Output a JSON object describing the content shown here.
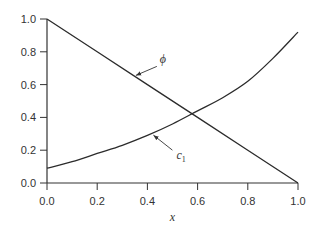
{
  "chart_data": {
    "type": "line",
    "title": "",
    "xlabel": "x",
    "ylabel": "",
    "xlim": [
      0.0,
      1.0
    ],
    "ylim": [
      0.0,
      1.0
    ],
    "x_ticks": [
      "0.0",
      "0.2",
      "0.4",
      "0.6",
      "0.8",
      "1.0"
    ],
    "y_ticks": [
      "0.0",
      "0.2",
      "0.4",
      "0.6",
      "0.8",
      "1.0"
    ],
    "grid": false,
    "series": [
      {
        "name": "phi",
        "label": "ϕ",
        "x": [
          0.0,
          0.2,
          0.4,
          0.6,
          0.8,
          1.0
        ],
        "y": [
          1.0,
          0.8,
          0.6,
          0.4,
          0.2,
          0.0
        ]
      },
      {
        "name": "c1",
        "label": "c",
        "label_sub": "1",
        "x": [
          0.0,
          0.1,
          0.2,
          0.3,
          0.4,
          0.5,
          0.6,
          0.7,
          0.8,
          0.9,
          1.0
        ],
        "y": [
          0.09,
          0.13,
          0.18,
          0.23,
          0.29,
          0.36,
          0.44,
          0.52,
          0.62,
          0.76,
          0.92
        ]
      }
    ],
    "annotations": [
      {
        "series": "phi",
        "text": "ϕ",
        "arrow_to_x": 0.35
      },
      {
        "series": "c1",
        "text": "c",
        "sub": "1",
        "arrow_to_x": 0.42
      }
    ]
  }
}
